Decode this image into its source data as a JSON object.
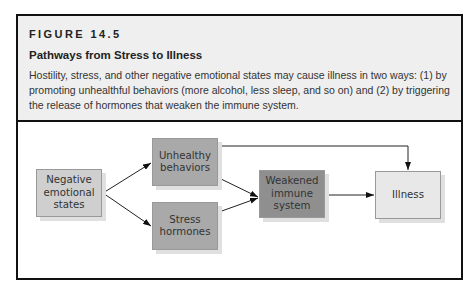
{
  "figure": {
    "label": "FIGURE 14.5",
    "title": "Pathways from Stress to Illness",
    "caption": "Hostility, stress, and other negative emotional states may cause illness in two ways: (1) by promoting unhealthful behaviors (more alcohol, less sleep, and so on) and (2) by triggering the release of hormones that weaken the immune system."
  },
  "diagram": {
    "nodes": [
      {
        "id": "negative",
        "label": "Negative emotional states",
        "color": "#cfcfcf"
      },
      {
        "id": "unhealthy",
        "label": "Unhealthy behaviors",
        "color": "#a9a9a9"
      },
      {
        "id": "stress",
        "label": "Stress hormones",
        "color": "#a9a9a9"
      },
      {
        "id": "weakened",
        "label": "Weakened immune system",
        "color": "#8f8f8f"
      },
      {
        "id": "illness",
        "label": "Illness",
        "color": "#e8e8e8"
      }
    ],
    "edges": [
      {
        "from": "negative",
        "to": "unhealthy"
      },
      {
        "from": "negative",
        "to": "stress"
      },
      {
        "from": "unhealthy",
        "to": "weakened"
      },
      {
        "from": "stress",
        "to": "weakened"
      },
      {
        "from": "unhealthy",
        "to": "illness"
      },
      {
        "from": "weakened",
        "to": "illness"
      }
    ]
  }
}
